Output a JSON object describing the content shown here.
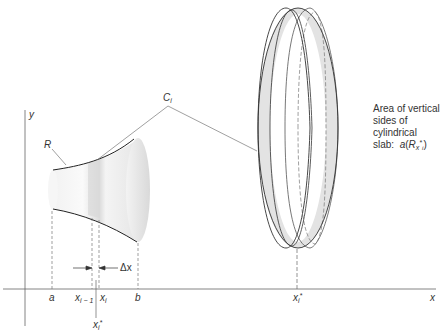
{
  "figure": {
    "type": "solid-of-revolution-cylindrical-shell-diagram",
    "colors": {
      "stroke": "#3a3a3a",
      "guide": "#777777",
      "fill_light": "#e4e4e4",
      "fill_solid": "#ededed",
      "background": "#ffffff"
    },
    "axes": {
      "y_label": "y",
      "x_label": "x"
    },
    "labels": {
      "region": "R",
      "cylinder": "C",
      "cylinder_sub": "i",
      "a": "a",
      "b": "b",
      "x_prev": "x",
      "x_prev_sub": "i − 1",
      "x_i": "x",
      "x_i_sub": "i",
      "x_star": "x",
      "x_star_sub": "i",
      "x_star_sup": "*",
      "x_star_ring": "x",
      "x_star_ring_sub": "i",
      "x_star_ring_sup": "*",
      "delta_x": "Δx"
    },
    "caption": {
      "line1": "Area of vertical",
      "line2": "sides of cylindrical",
      "line3_prefix": "slab:  ",
      "formula_a": "a",
      "formula_open": "(",
      "formula_R": "R",
      "formula_R_sub": "x",
      "formula_star_sup": "*",
      "formula_star_sub": "i",
      "formula_close": ")"
    }
  }
}
